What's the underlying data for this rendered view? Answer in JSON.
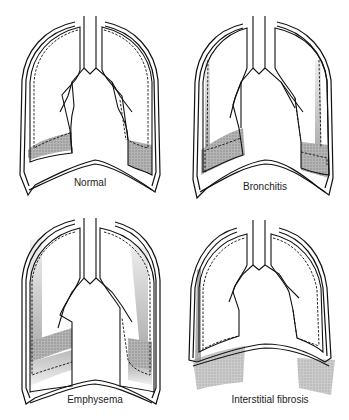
{
  "figure": {
    "panels": [
      {
        "id": "normal",
        "label": "Normal"
      },
      {
        "id": "bronchitis",
        "label": "Bronchitis"
      },
      {
        "id": "emphysema",
        "label": "Emphysema"
      },
      {
        "id": "interstitial-fibrosis",
        "label": "Interstitial fibrosis"
      }
    ]
  },
  "colors": {
    "line": "#111111",
    "shade": "#9a9a9a",
    "background": "#ffffff"
  }
}
